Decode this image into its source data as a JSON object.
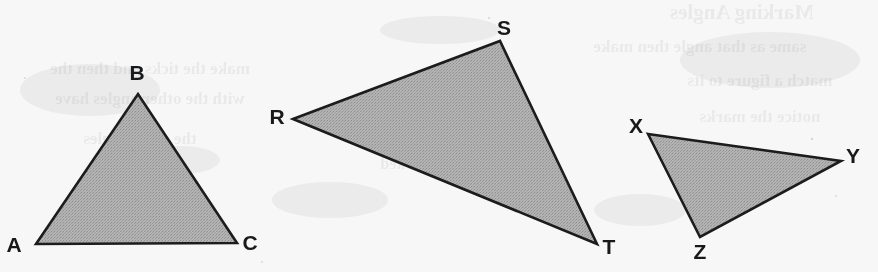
{
  "figure": {
    "background_color": "#f7f7f7",
    "width": 878,
    "height": 272
  },
  "style": {
    "fill_color": "#adadad",
    "stroke_color": "#1a1c1d",
    "stroke_width": 2.6,
    "label_color": "#17191a",
    "label_font_size": 21
  },
  "triangles": [
    {
      "id": "triangle-abc",
      "name": "Triangle ABC",
      "points": "36,244 138,94 237,243",
      "vertices": [
        {
          "label": "A",
          "x": 36,
          "y": 244,
          "label_x": 14,
          "label_y": 246,
          "anchor": "middle"
        },
        {
          "label": "B",
          "x": 138,
          "y": 94,
          "label_x": 137,
          "label_y": 74,
          "anchor": "middle"
        },
        {
          "label": "C",
          "x": 237,
          "y": 243,
          "label_x": 250,
          "label_y": 244,
          "anchor": "middle"
        }
      ]
    },
    {
      "id": "triangle-rst",
      "name": "Triangle RST",
      "points": "293,119 500,41 597,244",
      "vertices": [
        {
          "label": "R",
          "x": 293,
          "y": 119,
          "label_x": 277,
          "label_y": 118,
          "anchor": "middle"
        },
        {
          "label": "S",
          "x": 500,
          "y": 41,
          "label_x": 504,
          "label_y": 29,
          "anchor": "middle"
        },
        {
          "label": "T",
          "x": 597,
          "y": 244,
          "label_x": 609,
          "label_y": 248,
          "anchor": "middle"
        }
      ]
    },
    {
      "id": "triangle-xyz",
      "name": "Triangle XYZ",
      "points": "648,134 841,161 700,237",
      "vertices": [
        {
          "label": "X",
          "x": 648,
          "y": 134,
          "label_x": 636,
          "label_y": 127,
          "anchor": "middle"
        },
        {
          "label": "Y",
          "x": 841,
          "y": 161,
          "label_x": 853,
          "label_y": 157,
          "anchor": "middle"
        },
        {
          "label": "Z",
          "x": 700,
          "y": 237,
          "label_x": 700,
          "label_y": 253,
          "anchor": "middle"
        }
      ]
    }
  ],
  "background_show_through": {
    "description": "Faint mirrored ink bleed-through from the reverse page",
    "lines": [
      {
        "id": "ghost-1",
        "text": "Marking Angles",
        "x": 742,
        "y": 14,
        "size": 21,
        "opacity": 0.075
      },
      {
        "id": "ghost-2",
        "text": "same as that angle then make",
        "x": 700,
        "y": 48,
        "size": 17,
        "opacity": 0.055
      },
      {
        "id": "ghost-3",
        "text": "make the ticks and then the",
        "x": 150,
        "y": 70,
        "size": 17,
        "opacity": 0.05
      },
      {
        "id": "ghost-4",
        "text": "with the other angles have",
        "x": 150,
        "y": 100,
        "size": 17,
        "opacity": 0.05
      },
      {
        "id": "ghost-5",
        "text": "match a figure to its",
        "x": 760,
        "y": 82,
        "size": 17,
        "opacity": 0.05
      },
      {
        "id": "ghost-6",
        "text": "notice the marks",
        "x": 760,
        "y": 118,
        "size": 17,
        "opacity": 0.048
      },
      {
        "id": "ghost-7",
        "text": "the same angles",
        "x": 140,
        "y": 140,
        "size": 17,
        "opacity": 0.042
      },
      {
        "id": "ghost-8",
        "text": "congruent sides",
        "x": 430,
        "y": 120,
        "size": 16,
        "opacity": 0.035
      },
      {
        "id": "ghost-9",
        "text": "are marked",
        "x": 420,
        "y": 165,
        "size": 16,
        "opacity": 0.033
      },
      {
        "id": "ghost-10",
        "text": "triangles below",
        "x": 130,
        "y": 186,
        "size": 16,
        "opacity": 0.032
      }
    ]
  }
}
